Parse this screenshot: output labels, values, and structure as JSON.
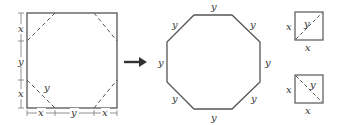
{
  "diagram": {
    "colors": {
      "stroke": "#555555",
      "text": "#333333",
      "background": "#ffffff"
    },
    "left_square": {
      "vertical_labels": [
        "x",
        "y",
        "x"
      ],
      "horizontal_labels": [
        "x",
        "y",
        "x"
      ],
      "inner_label": "y"
    },
    "arrow": {
      "direction": "right"
    },
    "octagon": {
      "side_labels": [
        "y",
        "y",
        "y",
        "y",
        "y",
        "y",
        "y",
        "y"
      ]
    },
    "small_squares": [
      {
        "side_left": "x",
        "side_bottom": "x",
        "diagonal_label": "y",
        "diagonal": "bottom-left-to-top-right"
      },
      {
        "side_left": "x",
        "side_bottom": "x",
        "diagonal_label": "y",
        "diagonal": "top-left-to-bottom-right"
      }
    ]
  }
}
